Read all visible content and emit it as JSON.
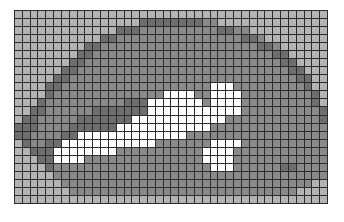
{
  "image": {
    "title": "Pixelated mosaic grid image",
    "description": "Low-resolution grayscale mosaic with visible dark grid lines forming a creature-like shape",
    "width_px": 344,
    "height_px": 222,
    "background_color": "#ffffff"
  },
  "grid": {
    "left_px": 14,
    "top_px": 10,
    "width_px": 314,
    "height_px": 194,
    "columns": 40,
    "rows": 24,
    "line_color": "#2b2b2b",
    "line_width_px": 1
  },
  "palette": {
    "light_gray": "#b4b4b4",
    "light_gray_alt": "#a3a3a3",
    "medium_gray": "#8a8a8a",
    "dark_gray": "#6e6e6e",
    "white": "#ffffff",
    "pale_gray": "#c4c4c4"
  },
  "cells": [
    "0000000000000000000000000000000000000000",
    "0000000000000000333333332200000000000000",
    "0000000000000333222222222233220000000000",
    "0000000000033222222222222222233200000000",
    "0000000003322222222222222222222332000000",
    "0000000033222222222222222222222223300000",
    "0000000332222222222222222222222222330000",
    "0000003322222222222222222222222222233000",
    "0000033222222222222222222222222222223300",
    "0000332222222222222222222444222222222300",
    "0000322222222222222444422444422222222230",
    "0003222222222233344444442444422222222230",
    "0033222222333333344444444444422222222223",
    "0332222233333334444444444442222222222223",
    "3332222333333444444444444222222222222222",
    "3322223344444444444444222222222222222222",
    "0322334444444444442222222444422222222222",
    "0033344444444222222222224444222222222222",
    "0003344442222222222222224444222222222222",
    "0000322222222222222222222444222222332222",
    "0000022222222222222222222222222222222222",
    "0000002222222222222222222222222222222200",
    "0000000222222222222222222222222222220000",
    "0000000000000000000000000000000000000000"
  ],
  "cells_note": "Each character is a palette index: 0=light_gray,1=light_gray_alt,2=medium_gray,3=dark_gray,4=white,5=pale_gray"
}
